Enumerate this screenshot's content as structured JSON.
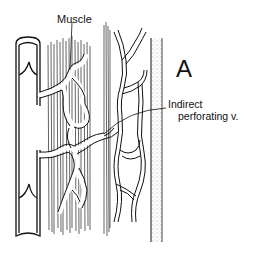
{
  "figure": {
    "panel_label": "A",
    "labels": {
      "muscle": "Muscle",
      "perforator_line1": "Indirect",
      "perforator_line2": "perforating v."
    },
    "structures": [
      "deep vein with valves",
      "muscle fibers",
      "intramuscular venous plexus",
      "superficial venous network",
      "deep fascia (stippled)"
    ],
    "colors": {
      "ink": "#111111",
      "background": "#ffffff",
      "stipple": "#555555"
    }
  }
}
